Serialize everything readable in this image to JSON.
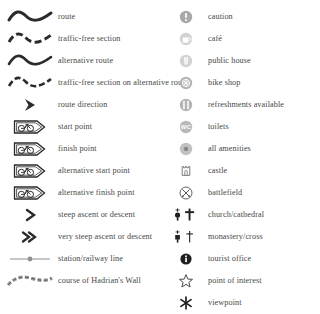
{
  "legend": {
    "title": "Map legend / key",
    "colors": {
      "ink": "#3a3a3a",
      "label": "#474747",
      "symbol_dark": "#2b2b2b",
      "symbol_grey": "#9d9d9d",
      "background": "#ffffff"
    },
    "left_column": [
      {
        "id": "route",
        "label": "route",
        "icon": "wavy-line-solid-icon"
      },
      {
        "id": "traffic-free-section",
        "label": "traffic-free section",
        "icon": "wavy-line-dashed-icon"
      },
      {
        "id": "alternative-route",
        "label": "alternative route",
        "icon": "wavy-line-solid-thin-icon"
      },
      {
        "id": "traffic-free-section-on-alternative-route",
        "label": "traffic-free section on alternative route",
        "icon": "wavy-line-dashed-thin-icon"
      },
      {
        "id": "route-direction",
        "label": "route direction",
        "icon": "chevron-right-filled-icon"
      },
      {
        "id": "start-point",
        "label": "start point",
        "icon": "bicycle-banner-icon"
      },
      {
        "id": "finish-point",
        "label": "finish point",
        "icon": "bicycle-banner-icon"
      },
      {
        "id": "alternative-start-point",
        "label": "alternative start point",
        "icon": "bicycle-banner-icon"
      },
      {
        "id": "alternative-finish-point",
        "label": "alternative finish point",
        "icon": "bicycle-banner-icon"
      },
      {
        "id": "steep-ascent-or-descent",
        "label": "steep ascent or descent",
        "icon": "single-chevron-icon"
      },
      {
        "id": "very-steep-ascent-or-descent",
        "label": "very steep ascent or descent",
        "icon": "double-chevron-icon"
      },
      {
        "id": "station-railway-line",
        "label": "station/railway line",
        "icon": "railway-station-line-icon"
      },
      {
        "id": "course-of-hadrians-wall",
        "label": "course of Hadrian's Wall",
        "icon": "hadrians-wall-icon"
      }
    ],
    "right_column": [
      {
        "id": "caution",
        "label": "caution",
        "icon": "exclamation-circle-icon"
      },
      {
        "id": "cafe",
        "label": "café",
        "icon": "cup-circle-icon"
      },
      {
        "id": "public-house",
        "label": "public house",
        "icon": "pint-glass-circle-icon"
      },
      {
        "id": "bike-shop",
        "label": "bike shop",
        "icon": "bike-wheel-circle-icon"
      },
      {
        "id": "refreshments-available",
        "label": "refreshments available",
        "icon": "cutlery-circle-icon"
      },
      {
        "id": "toilets",
        "label": "toilets",
        "icon": "wc-circle-icon"
      },
      {
        "id": "all-amenities",
        "label": "all amenities",
        "icon": "filled-dot-circle-icon"
      },
      {
        "id": "castle",
        "label": "castle",
        "icon": "castle-icon"
      },
      {
        "id": "battlefield",
        "label": "battlefield",
        "icon": "crossed-swords-circle-icon"
      },
      {
        "id": "church-cathedral",
        "label": "church/cathedral",
        "icon": "church-cathedral-icon"
      },
      {
        "id": "monastery-cross",
        "label": "monastery/cross",
        "icon": "monastery-cross-icon"
      },
      {
        "id": "tourist-office",
        "label": "tourist office",
        "icon": "information-circle-icon"
      },
      {
        "id": "point-of-interest",
        "label": "point of interest",
        "icon": "star-outline-icon"
      },
      {
        "id": "viewpoint",
        "label": "viewpoint",
        "icon": "asterisk-icon"
      }
    ]
  }
}
